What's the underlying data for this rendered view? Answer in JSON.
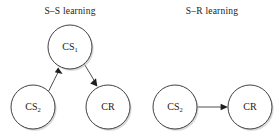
{
  "figure": {
    "background_color": "#ffffff",
    "node_fill": "#ffffff",
    "node_stroke": "#2b2b2b",
    "edge_color": "#3a3a3a",
    "text_color": "#1a1a1a"
  },
  "panels": [
    {
      "id": "s-s-learning",
      "title": "S–S learning",
      "title_x": 70,
      "title_y": 14,
      "nodes": [
        {
          "id": "cs1",
          "label": "CS",
          "subscript": "1",
          "cx": 70,
          "cy": 47,
          "r": 22
        },
        {
          "id": "cs2",
          "label": "CS",
          "subscript": "2",
          "cx": 33,
          "cy": 107,
          "r": 22
        },
        {
          "id": "cr",
          "label": "CR",
          "subscript": "",
          "cx": 108,
          "cy": 107,
          "r": 22
        }
      ],
      "edges": [
        {
          "id": "cs2-to-cs1",
          "from": "cs2",
          "to": "cs1",
          "direction": "up-right",
          "arrowhead": "solid"
        },
        {
          "id": "cs1-to-cr",
          "from": "cs1",
          "to": "cr",
          "direction": "down-right",
          "arrowhead": "solid"
        }
      ]
    },
    {
      "id": "s-r-learning",
      "title": "S–R learning",
      "title_x": 212,
      "title_y": 14,
      "nodes": [
        {
          "id": "cs2r",
          "label": "CS",
          "subscript": "2",
          "cx": 175,
          "cy": 107,
          "r": 22
        },
        {
          "id": "crr",
          "label": "CR",
          "subscript": "",
          "cx": 250,
          "cy": 107,
          "r": 22
        }
      ],
      "edges": [
        {
          "id": "cs2-to-cr",
          "from": "cs2r",
          "to": "crr",
          "direction": "right",
          "arrowhead": "solid"
        }
      ]
    }
  ]
}
